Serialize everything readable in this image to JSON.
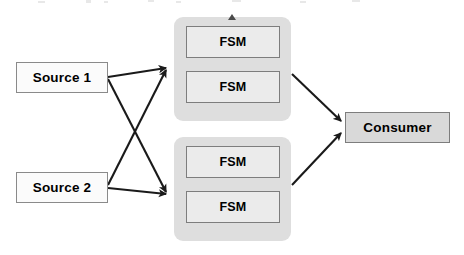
{
  "diagram": {
    "canvas": {
      "width": 464,
      "height": 255,
      "background": "#ffffff"
    },
    "palette": {
      "source_fill": "#fbfbfb",
      "group_fill": "#dedede",
      "fsm_fill": "#ebebeb",
      "consumer_fill": "#d9d9d9",
      "border": "#7d7d7d",
      "edge": "#1a1a1a",
      "marker": "#4a4a4a"
    },
    "sources": [
      {
        "id": "source-1",
        "label": "Source 1"
      },
      {
        "id": "source-2",
        "label": "Source 2"
      }
    ],
    "groups": [
      {
        "id": "group-upper",
        "marker": "triangle-up-marker",
        "nodes": [
          {
            "id": "fsm-upper-1",
            "label": "FSM"
          },
          {
            "id": "fsm-upper-2",
            "label": "FSM"
          }
        ]
      },
      {
        "id": "group-lower",
        "marker": null,
        "nodes": [
          {
            "id": "fsm-lower-1",
            "label": "FSM"
          },
          {
            "id": "fsm-lower-2",
            "label": "FSM"
          }
        ]
      }
    ],
    "consumer": {
      "id": "consumer",
      "label": "Consumer"
    },
    "edges": [
      {
        "id": "edge-source1-upper",
        "from": "source-1",
        "to": "group-upper",
        "arrowhead": true
      },
      {
        "id": "edge-source1-lower",
        "from": "source-1",
        "to": "group-lower",
        "arrowhead": true
      },
      {
        "id": "edge-source2-upper",
        "from": "source-2",
        "to": "group-upper",
        "arrowhead": true
      },
      {
        "id": "edge-source2-lower",
        "from": "source-2",
        "to": "group-lower",
        "arrowhead": true
      },
      {
        "id": "edge-upper-consumer",
        "from": "group-upper",
        "to": "consumer",
        "arrowhead": true
      },
      {
        "id": "edge-lower-consumer",
        "from": "group-lower",
        "to": "consumer",
        "arrowhead": true
      }
    ]
  }
}
